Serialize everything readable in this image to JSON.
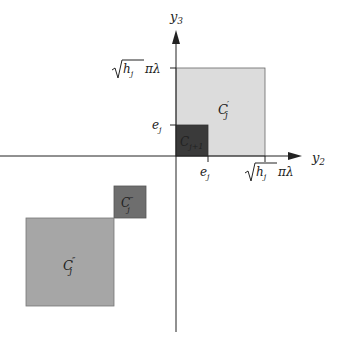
{
  "axes": {
    "x_label": "y",
    "x_label_sub": "2",
    "y_label": "y",
    "y_label_sub": "3"
  },
  "ticks": {
    "e_j_base": "e",
    "e_j_sub": "j",
    "sqrt_h": "h",
    "sqrt_h_sub": "j",
    "pi_lambda": "πλ"
  },
  "regions": {
    "c_prime": {
      "base": "C",
      "sub": "j",
      "sup": "′",
      "color": "#dcdcdc"
    },
    "c_next": {
      "base": "C",
      "sub": "j+1",
      "color": "#3a3a3a"
    },
    "c_triple": {
      "base": "C",
      "sub": "j",
      "sup": "‴",
      "color": "#6e6e6e"
    },
    "c_double": {
      "base": "C",
      "sub": "j",
      "sup": "″",
      "color": "#a6a6a6"
    }
  },
  "colors": {
    "axis": "#222222",
    "border": "#555555"
  }
}
